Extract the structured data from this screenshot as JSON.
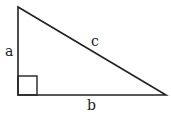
{
  "diagram": {
    "type": "right-triangle",
    "labels": {
      "a": "a",
      "b": "b",
      "c": "c"
    },
    "stroke_color": "#222222",
    "background": "#ffffff"
  }
}
